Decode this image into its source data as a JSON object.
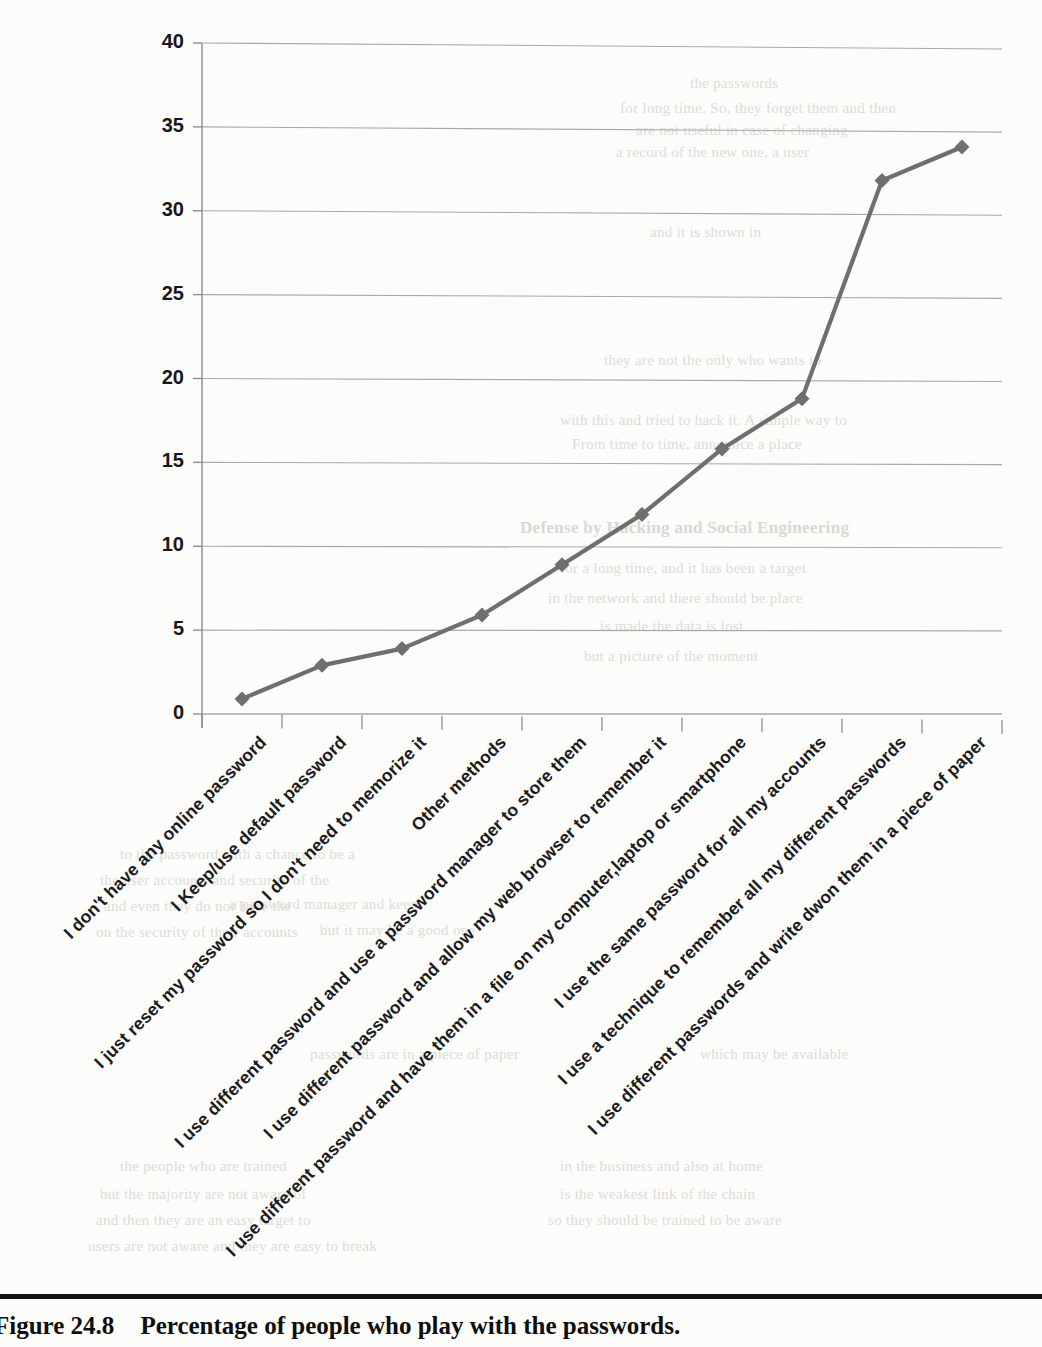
{
  "figure": {
    "label": "Figure 24.8",
    "caption": "Percentage of people who play with the passwords."
  },
  "chart_data": {
    "type": "line",
    "title": "",
    "xlabel": "",
    "ylabel": "",
    "ylim": [
      0,
      40
    ],
    "yticks": [
      0,
      5,
      10,
      15,
      20,
      25,
      30,
      35,
      40
    ],
    "grid": true,
    "legend": "none",
    "line_color": "#6f6f6f",
    "marker": "diamond",
    "categories": [
      "I don't have any online password",
      "I Keep/use default password",
      "I just reset my password so I don't need to memorize it",
      "Other methods",
      "I use different password and use a password manager to store them",
      "I use different password and allow my web browser to remember it",
      "I use different password and have them in a file on my computer,laptop or smartphone",
      "I use the same password for all my accounts",
      "I use a technique to remember all my different passwords",
      "I use different passwords and write dwon them in a piece of paper"
    ],
    "values": [
      0.9,
      2.9,
      3.9,
      5.9,
      8.9,
      11.9,
      15.8,
      18.8,
      31.8,
      33.8
    ]
  },
  "bleed_text": [
    {
      "t": "the passwords",
      "x": 690,
      "y": 75
    },
    {
      "t": "for long time. So, they forget them and then",
      "x": 620,
      "y": 100
    },
    {
      "t": "are not useful in case of changing",
      "x": 636,
      "y": 122
    },
    {
      "t": "a record of the new one, a user",
      "x": 616,
      "y": 144
    },
    {
      "t": "and it is shown in",
      "x": 650,
      "y": 224
    },
    {
      "t": "they are not the only who wants to",
      "x": 604,
      "y": 352
    },
    {
      "t": "with this and tried to hack it. A simple way to",
      "x": 560,
      "y": 412
    },
    {
      "t": "From time to time, announce a place",
      "x": 572,
      "y": 436
    },
    {
      "t": "Defense by Hacking and Social Engineering",
      "x": 520,
      "y": 518,
      "b": true
    },
    {
      "t": "for a long time, and it has been a target",
      "x": 560,
      "y": 560
    },
    {
      "t": "in the network and there should be place",
      "x": 548,
      "y": 590
    },
    {
      "t": "is made the data is lost",
      "x": 600,
      "y": 618
    },
    {
      "t": "but a picture of the moment",
      "x": 584,
      "y": 648
    },
    {
      "t": "to the password with a chance to be a",
      "x": 120,
      "y": 846
    },
    {
      "t": "the user accounts and security of the",
      "x": 100,
      "y": 872
    },
    {
      "t": "and even they do not have the",
      "x": 104,
      "y": 898
    },
    {
      "t": "on the security of their accounts",
      "x": 96,
      "y": 924
    },
    {
      "t": "a password manager and keep",
      "x": 230,
      "y": 896
    },
    {
      "t": "but it may be a good one",
      "x": 320,
      "y": 922
    },
    {
      "t": "passwords are in a piece of paper",
      "x": 310,
      "y": 1046
    },
    {
      "t": "which may be available",
      "x": 700,
      "y": 1046
    },
    {
      "t": "the people who are trained",
      "x": 120,
      "y": 1158
    },
    {
      "t": "but the majority are not aware of",
      "x": 100,
      "y": 1186
    },
    {
      "t": "and then they are an easy target to",
      "x": 96,
      "y": 1212
    },
    {
      "t": "users are not aware and they are easy to break",
      "x": 88,
      "y": 1238
    },
    {
      "t": "in the business and also at home",
      "x": 560,
      "y": 1158
    },
    {
      "t": "is the weakest link of the chain",
      "x": 560,
      "y": 1186
    },
    {
      "t": "so they should be trained to be aware",
      "x": 548,
      "y": 1212
    }
  ]
}
